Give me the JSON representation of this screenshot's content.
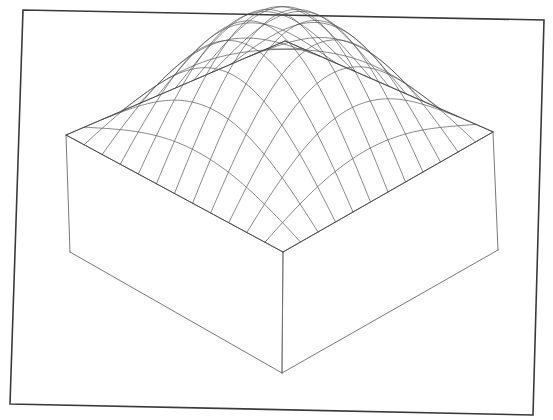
{
  "figure": {
    "title": "",
    "background_color": "#ffffff",
    "border_color": "#3a3a3a",
    "mesh_color": "#4a4a4a",
    "box_color": "#555555",
    "width_px": 553,
    "height_px": 420,
    "frame_points": "23,10 544,20 533,415 10,404",
    "frame_note": "scanned-page outer rectangle, slightly rotated"
  },
  "chart_data": {
    "type": "surface",
    "render": "wireframe-mesh",
    "title": "",
    "subtitle": "",
    "xlabel": "",
    "ylabel": "",
    "zlabel": "",
    "grid": false,
    "legend": "none",
    "tick_labels": [],
    "annotations": [],
    "surface_function": "z = cos(pi*x/2) * cos(pi*y/2)",
    "mesh_rows": 12,
    "mesh_cols": 12,
    "x": [
      -1,
      1
    ],
    "y": [
      -1,
      1
    ],
    "xlim": [
      -1,
      1
    ],
    "ylim": [
      -1,
      1
    ],
    "zlim": [
      0,
      1
    ],
    "z_peak": 1.0,
    "z_min": 0.0,
    "peak_location": [
      0,
      0
    ],
    "view": {
      "azimuth_deg": 45,
      "elevation_deg": 26,
      "perspective": true,
      "distance": 7.5
    },
    "projection": {
      "center_x": 283,
      "center_y": 250,
      "scale": 215,
      "z_scale": 150,
      "box_top_y": 250,
      "box_bottom_y": 370
    },
    "box_corners_px": {
      "far": [
        285,
        41
      ],
      "left_top": [
        66,
        135
      ],
      "right_top": [
        493,
        132
      ],
      "near_top": [
        283,
        252
      ],
      "left_bottom": [
        70,
        252
      ],
      "right_bottom": [
        498,
        250
      ],
      "near_bottom": [
        282,
        373
      ]
    },
    "apex_px": [
      281,
      101
    ],
    "values_note": "z sampled on a 13x13 lattice of the unit square; z(x,y)=cos(pi*x/2)*cos(pi*y/2)",
    "z_matrix_row_sample": [
      0.0,
      0.0,
      0.0,
      0.0,
      0.0,
      0.0,
      0.0,
      0.0,
      0.0,
      0.0,
      0.0,
      0.0,
      0.0
    ],
    "z_matrix_center_row": [
      0.0,
      0.259,
      0.5,
      0.707,
      0.866,
      0.966,
      1.0,
      0.966,
      0.866,
      0.707,
      0.5,
      0.259,
      0.0
    ]
  }
}
